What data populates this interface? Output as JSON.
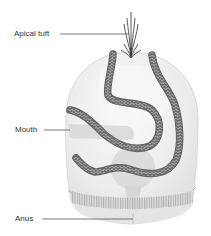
{
  "diagram": {
    "labels": [
      {
        "id": "apical-tuft",
        "text": "Apical tuft"
      },
      {
        "id": "mouth",
        "text": "Mouth"
      },
      {
        "id": "anus",
        "text": "Anus"
      }
    ]
  },
  "colors": {
    "body_fill": "#ececec",
    "body_highlight": "#f8f8f8",
    "band": "#6e6e6e",
    "band_chevron": "#9a9a9a",
    "leader_line": "#555555",
    "label_text": "#333333",
    "gut": "#d9d9d9"
  }
}
